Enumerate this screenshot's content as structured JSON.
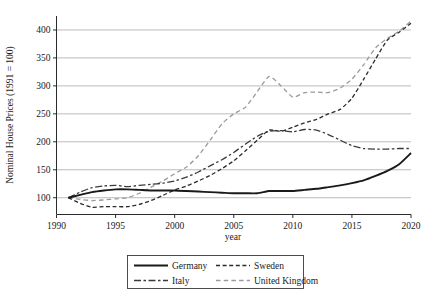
{
  "chart_data": {
    "type": "line",
    "title": "",
    "xlabel": "year",
    "ylabel": "Nominal House Prices (1991 = 100)",
    "xlim": [
      1990,
      2020
    ],
    "ylim": [
      70,
      425
    ],
    "xticks": [
      1990,
      1995,
      2000,
      2005,
      2010,
      2015,
      2020
    ],
    "yticks": [
      100,
      150,
      200,
      250,
      300,
      350,
      400
    ],
    "grid": "horizontal",
    "legend_position": "below-axes",
    "x": [
      1991,
      1992,
      1993,
      1994,
      1995,
      1996,
      1997,
      1998,
      1999,
      2000,
      2001,
      2002,
      2003,
      2004,
      2005,
      2006,
      2007,
      2008,
      2009,
      2010,
      2011,
      2012,
      2013,
      2014,
      2015,
      2016,
      2017,
      2018,
      2019,
      2020
    ],
    "series": [
      {
        "name": "Germany",
        "style": "solid",
        "color": "#1a1a1a",
        "width": 1.9,
        "values": [
          100,
          105,
          110,
          113,
          115,
          115,
          114,
          113,
          113,
          113,
          112,
          111,
          110,
          109,
          108,
          108,
          108,
          112,
          112,
          112,
          114,
          116,
          119,
          122,
          126,
          131,
          139,
          148,
          160,
          180
        ]
      },
      {
        "name": "Sweden",
        "style": "dashed",
        "color": "#2b2b2b",
        "width": 1.3,
        "values": [
          100,
          90,
          83,
          84,
          84,
          84,
          88,
          95,
          104,
          114,
          121,
          130,
          140,
          152,
          166,
          184,
          203,
          221,
          219,
          226,
          234,
          240,
          250,
          258,
          278,
          312,
          348,
          382,
          396,
          412
        ]
      },
      {
        "name": "Italy",
        "style": "dash-dot",
        "color": "#3a3a3a",
        "width": 1.3,
        "values": [
          100,
          110,
          118,
          121,
          122,
          120,
          122,
          124,
          126,
          130,
          137,
          146,
          157,
          168,
          181,
          196,
          210,
          219,
          220,
          218,
          222,
          221,
          213,
          203,
          193,
          188,
          187,
          187,
          188,
          188
        ]
      },
      {
        "name": "United Kingdom",
        "style": "dashed-light",
        "color": "#9a9a9a",
        "width": 1.3,
        "values": [
          100,
          97,
          95,
          96,
          98,
          100,
          108,
          119,
          130,
          143,
          155,
          175,
          203,
          232,
          250,
          262,
          290,
          317,
          300,
          280,
          288,
          289,
          288,
          296,
          312,
          338,
          368,
          385,
          398,
          416
        ]
      }
    ]
  },
  "axes": {
    "ytick_labels": [
      "100",
      "150",
      "200",
      "250",
      "300",
      "350",
      "400"
    ],
    "xtick_labels": [
      "1990",
      "1995",
      "2000",
      "2005",
      "2010",
      "2015",
      "2020"
    ],
    "x_axis_title": "year",
    "y_axis_title": "Nominal House Prices (1991 = 100)"
  },
  "legend": {
    "entries": [
      {
        "label": "Germany",
        "style": "solid"
      },
      {
        "label": "Sweden",
        "style": "dashed"
      },
      {
        "label": "Italy",
        "style": "dash-dot"
      },
      {
        "label": "United Kingdom",
        "style": "dashed-light"
      }
    ]
  }
}
